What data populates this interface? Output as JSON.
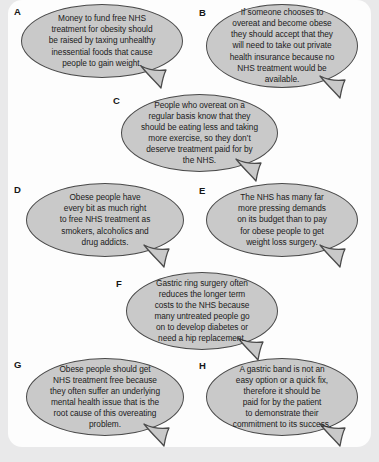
{
  "panel": {
    "background_color": "#e9e9ea",
    "card_color": "#fdfdfd",
    "bubble_fill": "#c9c9c9",
    "bubble_stroke": "#4a4a4a",
    "text_color": "#1b1b1b"
  },
  "bubbles": [
    {
      "label": "A",
      "text": "Money to fund free NHS\ntreatment for obesity should\nbe raised by taxing unhealthy\ninessential foods that cause\npeople to gain weight."
    },
    {
      "label": "B",
      "text": "If someone chooses to\novereat and become obese\nthey should accept that they\nwill need to take out private\nhealth insurance because no\nNHS treatment would be\navailable."
    },
    {
      "label": "C",
      "text": "People who overeat on a\nregular basis know that they\nshould be eating less and taking\nmore exercise, so they don’t\ndeserve treatment paid for by\nthe NHS."
    },
    {
      "label": "D",
      "text": "Obese people have\nevery bit as much right\nto free NHS treatment as\nsmokers, alcoholics and\ndrug addicts."
    },
    {
      "label": "E",
      "text": "The NHS has many far\nmore pressing demands\non its budget than to pay\nfor obese people to get\nweight loss surgery."
    },
    {
      "label": "F",
      "text": "Gastric ring surgery often\nreduces the longer term\ncosts to the NHS because\nmany untreated people go\non to develop diabetes or\nneed a hip replacement."
    },
    {
      "label": "G",
      "text": "Obese people should get\nNHS treatment free because\nthey often suffer an underlying\nmental health issue that is the\nroot cause of this overeating\nproblem."
    },
    {
      "label": "H",
      "text": "A gastric band is not an\neasy option or a quick fix,\ntherefore it should be\npaid for by the patient\nto demonstrate their\ncommitment to its success."
    }
  ]
}
